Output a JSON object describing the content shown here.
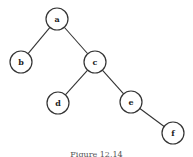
{
  "diagram": {
    "type": "binary-tree",
    "nodes": [
      {
        "id": "a",
        "label": "a",
        "x": 57,
        "y": 19
      },
      {
        "id": "b",
        "label": "b",
        "x": 21,
        "y": 62
      },
      {
        "id": "c",
        "label": "c",
        "x": 95,
        "y": 62
      },
      {
        "id": "d",
        "label": "d",
        "x": 58,
        "y": 103
      },
      {
        "id": "e",
        "label": "e",
        "x": 131,
        "y": 102
      },
      {
        "id": "f",
        "label": "f",
        "x": 173,
        "y": 133
      }
    ],
    "edges": [
      {
        "from": "a",
        "to": "b"
      },
      {
        "from": "a",
        "to": "c"
      },
      {
        "from": "c",
        "to": "d"
      },
      {
        "from": "c",
        "to": "e"
      },
      {
        "from": "e",
        "to": "f"
      }
    ],
    "node_radius": 11
  },
  "caption": "Figure 12.14"
}
